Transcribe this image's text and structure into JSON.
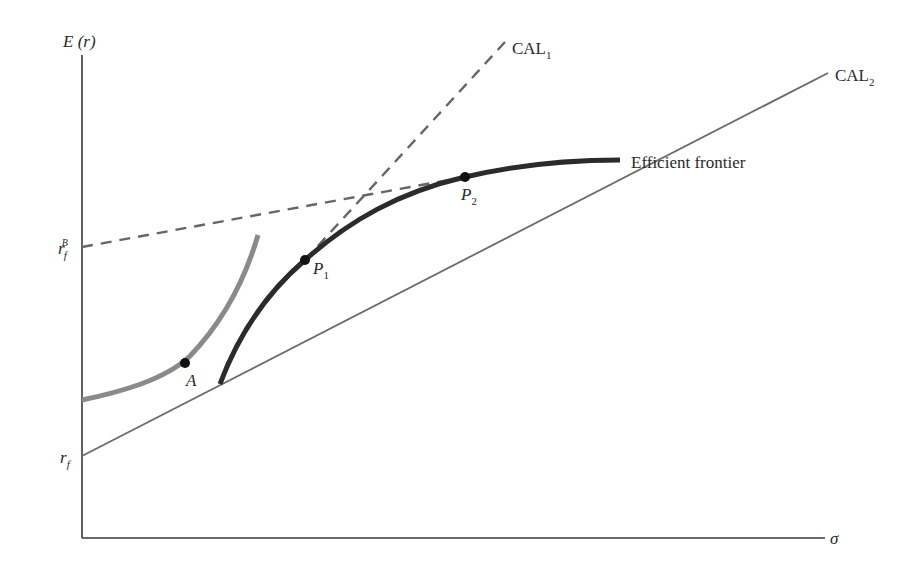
{
  "diagram": {
    "axes": {
      "y_label": "E (r)",
      "x_label": "σ"
    },
    "y_ticks": {
      "rf_borrow": {
        "base": "r",
        "sub": "f",
        "sup": "B"
      },
      "rf": {
        "base": "r",
        "sub": "f"
      }
    },
    "lines": {
      "cal1": {
        "base": "CAL",
        "sub": "1",
        "style": "dashed"
      },
      "cal2": {
        "base": "CAL",
        "sub": "2",
        "style": "solid"
      },
      "frontier": {
        "label": "Efficient frontier"
      },
      "borrow_line": {
        "style": "dashed"
      },
      "indifference_curve": {
        "style": "gray"
      }
    },
    "points": {
      "A": {
        "label": "A"
      },
      "P1": {
        "base": "P",
        "sub": "1"
      },
      "P2": {
        "base": "P",
        "sub": "2"
      }
    },
    "colors": {
      "ink": "#2a2a2a",
      "frontier": "#2b2b2b",
      "indifference": "#8a8a8a",
      "cal_line": "#6a6a6a",
      "dash": "#666666"
    }
  }
}
